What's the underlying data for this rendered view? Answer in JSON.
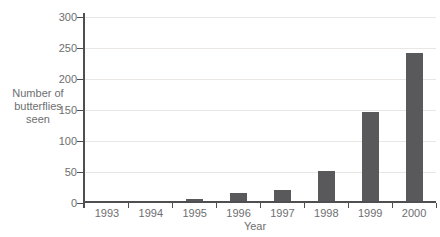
{
  "chart_data": {
    "type": "bar",
    "title": "",
    "categories": [
      "1993",
      "1994",
      "1995",
      "1996",
      "1997",
      "1998",
      "1999",
      "2000"
    ],
    "values": [
      0,
      0,
      5,
      15,
      20,
      50,
      145,
      240
    ],
    "xlabel": "Year",
    "ylabel": "Number of\nbutterflies\nseen",
    "ylim": [
      0,
      300
    ],
    "yticks": [
      0,
      50,
      100,
      150,
      200,
      250,
      300
    ],
    "grid": true,
    "legend": "none"
  },
  "colors": {
    "bar": "#59595b",
    "axis": "#4f4f51",
    "grid": "#e9e6e3",
    "text": "#6d6e70",
    "background": "#ffffff"
  }
}
